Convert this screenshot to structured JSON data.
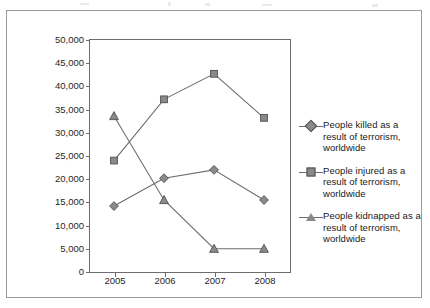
{
  "chart_data": {
    "type": "line",
    "title": "",
    "xlabel": "",
    "ylabel": "",
    "categories": [
      "2005",
      "2006",
      "2007",
      "2008"
    ],
    "ylim": [
      0,
      50000
    ],
    "ytick_labels": [
      "50,000",
      "45,000",
      "40,000",
      "35,000",
      "30,000",
      "25,000",
      "20,000",
      "15,000",
      "10,000",
      "5,000",
      "0"
    ],
    "ytick_values": [
      50000,
      45000,
      40000,
      35000,
      30000,
      25000,
      20000,
      15000,
      10000,
      5000,
      0
    ],
    "grid": false,
    "legend_position": "right",
    "series": [
      {
        "name": "People killed as a result of terrorism, worldwide",
        "marker": "diamond",
        "color": "#8a8a8a",
        "values": [
          14000,
          20000,
          21800,
          15300
        ]
      },
      {
        "name": "People injured as a result of terrorism, worldwide",
        "marker": "square",
        "color": "#8a8a8a",
        "values": [
          23800,
          37000,
          42500,
          33000
        ]
      },
      {
        "name": "People kidnapped as a result of terrorism, worldwide",
        "marker": "triangle",
        "color": "#8a8a8a",
        "values": [
          33400,
          15300,
          4800,
          4800
        ]
      }
    ]
  },
  "legend": {
    "items": [
      {
        "label": "People killed as a result of terrorism, worldwide",
        "marker": "diamond"
      },
      {
        "label": "People injured as a result of terrorism, worldwide",
        "marker": "square"
      },
      {
        "label": "People kidnapped as a result of terrorism, worldwide",
        "marker": "triangle"
      }
    ]
  },
  "colors": {
    "marker_fill": "#8a8a8a",
    "marker_stroke": "#4f4f4f",
    "line": "#6d6d6d",
    "axis": "#6d6d6d",
    "frame": "#9b9b9b",
    "text": "#1a1a1a"
  }
}
